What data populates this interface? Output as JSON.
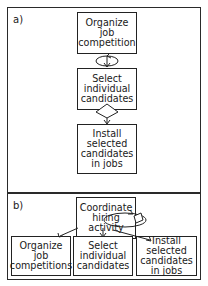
{
  "panel_a": {
    "label": "a)",
    "steps": [
      {
        "text": "Organize\njob\ncompetition"
      },
      {
        "text": "Select\nindividual\ncandidates"
      },
      {
        "text": "Install\nselected\ncandidates\nin jobs"
      }
    ],
    "connectors": [
      "loop-arrow",
      "diamond-decision"
    ]
  },
  "panel_b": {
    "label": "b)",
    "parent": {
      "text": "Coordinate\nhiring\nactivity"
    },
    "children": [
      {
        "text": "Organize\njob\ncompetitions"
      },
      {
        "text": "Select\nindividual\ncandidates"
      },
      {
        "text": "Install\nselected\ncandidates\nin jobs"
      }
    ],
    "connectors": [
      "loop-arrow",
      "diamond-decision"
    ]
  }
}
